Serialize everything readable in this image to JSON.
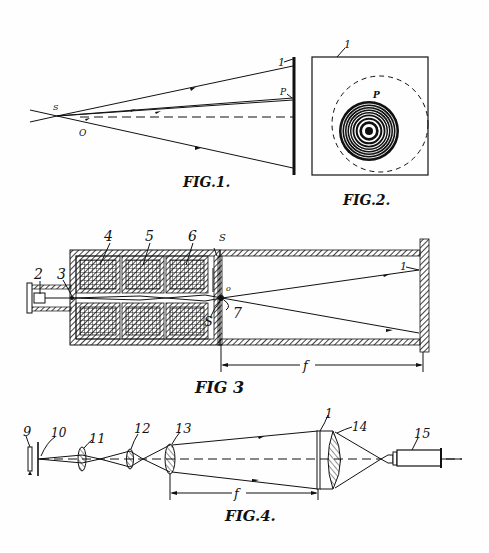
{
  "document": {
    "type": "patent-drawing-sheet",
    "figures": [
      {
        "id": "fig1",
        "caption": "FIG.1.",
        "labels": {
          "screen": "1",
          "source": "S",
          "point": "P",
          "origin": "O"
        }
      },
      {
        "id": "fig2",
        "caption": "FIG.2.",
        "labels": {
          "screen": "1",
          "point": "P"
        }
      },
      {
        "id": "fig3",
        "caption": "FIG 3",
        "labels": {
          "cathode": "2",
          "aperture": "3",
          "lens_coil_a": "4",
          "lens_coil_b": "5",
          "lens_coil_c": "6",
          "source_top": "S",
          "source_bottom": "S",
          "object": "o",
          "specimen": "7",
          "screen": "1",
          "distance": "f"
        }
      },
      {
        "id": "fig4",
        "caption": "FIG.4.",
        "labels": {
          "lamp": "9",
          "pinhole": "10",
          "lens_a": "11",
          "lens_b": "12",
          "lens_c": "13",
          "hologram": "1",
          "lens_d": "14",
          "eyepiece": "15",
          "distance": "f"
        }
      }
    ]
  },
  "colors": {
    "ink": "#111111",
    "paper": "#fefefe"
  }
}
